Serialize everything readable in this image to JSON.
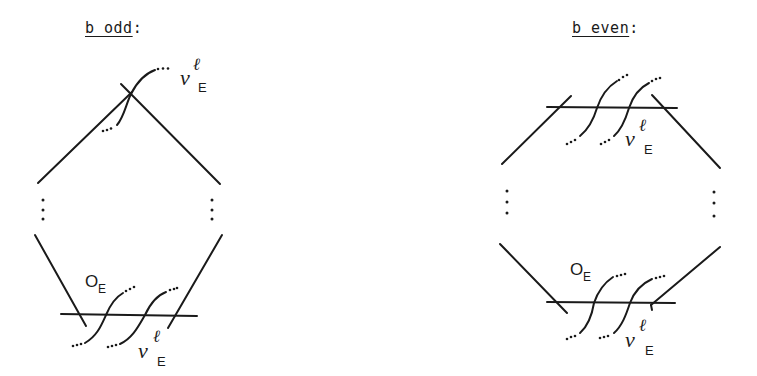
{
  "panels": [
    {
      "id": "odd",
      "title_main": "b odd",
      "title_suffix": ":",
      "labels": {
        "top_nu": "ν",
        "top_nu_sup": "ℓ",
        "top_nu_sub": "E",
        "bottom_o": "O",
        "bottom_o_sub": "E",
        "bottom_nu": "ν",
        "bottom_nu_sup": "ℓ",
        "bottom_nu_sub": "E"
      }
    },
    {
      "id": "even",
      "title_main": "b even",
      "title_suffix": ":",
      "labels": {
        "top_nu": "ν",
        "top_nu_sup": "ℓ",
        "top_nu_sub": "E",
        "bottom_o": "O",
        "bottom_o_sub": "E",
        "bottom_nu": "ν",
        "bottom_nu_sup": "ℓ",
        "bottom_nu_sub": "E"
      }
    }
  ],
  "colors": {
    "ink": "#1a1a1a",
    "background": "#ffffff"
  }
}
